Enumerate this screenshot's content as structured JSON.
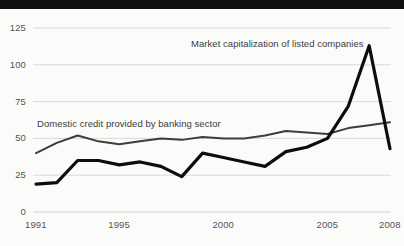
{
  "chart_data": {
    "type": "line",
    "title": "",
    "subtitle": "",
    "xlabel": "",
    "ylabel": "",
    "xlim": [
      1991,
      2008
    ],
    "ylim": [
      0,
      125
    ],
    "grid": true,
    "legend_position": "inline-annotation",
    "x": [
      1991,
      1992,
      1993,
      1994,
      1995,
      1996,
      1997,
      1998,
      1999,
      2000,
      2001,
      2002,
      2003,
      2004,
      2005,
      2006,
      2007,
      2008
    ],
    "y_ticks": [
      0,
      25,
      50,
      75,
      100,
      125
    ],
    "y_tick_labels": [
      "0",
      "25",
      "50",
      "75",
      "100",
      "125"
    ],
    "x_ticks": [
      1991,
      1995,
      2000,
      2005,
      2008
    ],
    "x_tick_labels": [
      "1991",
      "1995",
      "2000",
      "2005",
      "2008"
    ],
    "series": [
      {
        "name": "Domestic credit provided by banking sector",
        "color": "#3d3d3d",
        "width": 2.0,
        "values": [
          40,
          47,
          52,
          48,
          46,
          48,
          50,
          49,
          51,
          50,
          50,
          52,
          55,
          54,
          53,
          57,
          59,
          61
        ]
      },
      {
        "name": "Market capitalization of listed companies",
        "color": "#0d0d0d",
        "width": 3.2,
        "values": [
          19,
          20,
          35,
          35,
          32,
          34,
          31,
          24,
          40,
          37,
          34,
          31,
          41,
          44,
          50,
          72,
          113,
          43
        ]
      }
    ],
    "annotations": [
      {
        "text": "Market capitalization of listed companies",
        "x_px": 191,
        "y_px": 38,
        "series": "Market capitalization of listed companies"
      },
      {
        "text": "Domestic credit provided by banking sector",
        "x_px": 37,
        "y_px": 118,
        "series": "Domestic credit provided by banking sector"
      }
    ],
    "colors": {
      "background": "#fbfbfa",
      "grid": "#d6d6d6",
      "axis_text": "#555555",
      "annotation_text": "#3c3c3c",
      "top_bar": "#111111"
    }
  }
}
